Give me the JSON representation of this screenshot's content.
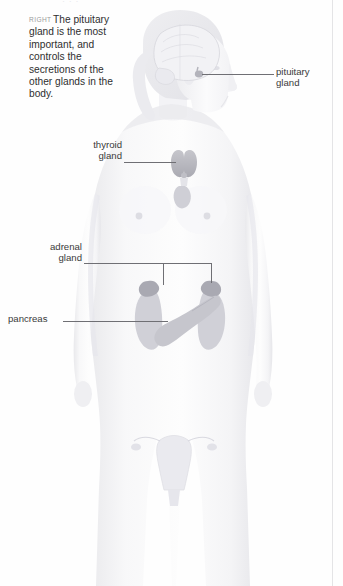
{
  "page": {
    "top_cut_text": "· · ·",
    "background_color": "#fefefe"
  },
  "caption": {
    "kicker": "RIGHT",
    "text": "The pituitary gland is the most important, and controls the secretions of the other glands in the body."
  },
  "figure": {
    "body_color": "#f3f3f5",
    "organ_color": "#b9b9bf",
    "leader_color": "#6f6f74"
  },
  "labels": [
    {
      "id": "pituitary",
      "line1": "pituitary",
      "line2": "gland"
    },
    {
      "id": "thyroid",
      "line1": "thyroid",
      "line2": "gland"
    },
    {
      "id": "adrenal",
      "line1": "adrenal",
      "line2": "gland"
    },
    {
      "id": "pancreas",
      "line1": "pancreas",
      "line2": ""
    }
  ]
}
